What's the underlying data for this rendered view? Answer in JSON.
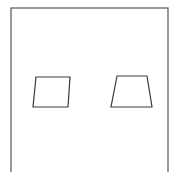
{
  "figure": {
    "title": "Two parallelograms inside a rectangular frame",
    "canvas": {
      "width": 178,
      "height": 172,
      "background_color": "#ffffff"
    },
    "frame": {
      "name": "outer-border",
      "shape": "rectangle",
      "x": 11,
      "y": 8,
      "width": 157,
      "height": 172,
      "stroke_color": "#555555",
      "stroke_width": 1.2,
      "fill_color": "#ffffff",
      "note": "bottom edge extends beyond the visible canvas"
    },
    "shapes": [
      {
        "name": "parallelogram-left",
        "type": "parallelogram",
        "points": "36,77 70,77 68,107 33,107",
        "vertices": [
          {
            "label": "top-left",
            "x": 36,
            "y": 77
          },
          {
            "label": "top-right",
            "x": 70,
            "y": 77
          },
          {
            "label": "bottom-right",
            "x": 68,
            "y": 107
          },
          {
            "label": "bottom-left",
            "x": 33,
            "y": 107
          }
        ],
        "stroke_color": "#3a3a3a",
        "stroke_width": 1.2,
        "fill_color": "#ffffff"
      },
      {
        "name": "parallelogram-right",
        "type": "parallelogram",
        "points": "117,76 147,76 152,107 111,107",
        "vertices": [
          {
            "label": "top-left",
            "x": 117,
            "y": 76
          },
          {
            "label": "top-right",
            "x": 147,
            "y": 76
          },
          {
            "label": "bottom-right",
            "x": 152,
            "y": 107
          },
          {
            "label": "bottom-left",
            "x": 111,
            "y": 107
          }
        ],
        "stroke_color": "#3a3a3a",
        "stroke_width": 1.2,
        "fill_color": "#ffffff"
      }
    ]
  }
}
